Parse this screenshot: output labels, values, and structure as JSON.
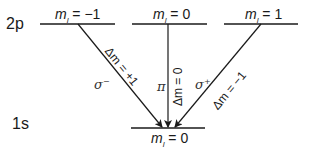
{
  "diagram": {
    "upper_level": {
      "name": "2p",
      "sublevels": [
        {
          "label": "m_l = −1",
          "m": "m",
          "sub": "l",
          "eq": "= −1"
        },
        {
          "label": "m_l = 0",
          "m": "m",
          "sub": "l",
          "eq": "= 0"
        },
        {
          "label": "m_l = 1",
          "m": "m",
          "sub": "l",
          "eq": "= 1"
        }
      ]
    },
    "lower_level": {
      "name": "1s",
      "sublevel": {
        "label": "m_l = 0",
        "m": "m",
        "sub": "l",
        "eq": "= 0"
      }
    },
    "transitions": [
      {
        "from": "m_l = −1",
        "polarization": "σ⁻",
        "pol_base": "σ",
        "pol_sup": "−",
        "selection": "Δm = +1"
      },
      {
        "from": "m_l = 0",
        "polarization": "π",
        "selection": "Δm = 0"
      },
      {
        "from": "m_l = 1",
        "polarization": "σ⁺",
        "pol_base": "σ",
        "pol_sup": "+",
        "selection": "Δm = −1"
      }
    ],
    "colors": {
      "line": "#1a1a1a",
      "text": "#1a1a1a"
    }
  }
}
